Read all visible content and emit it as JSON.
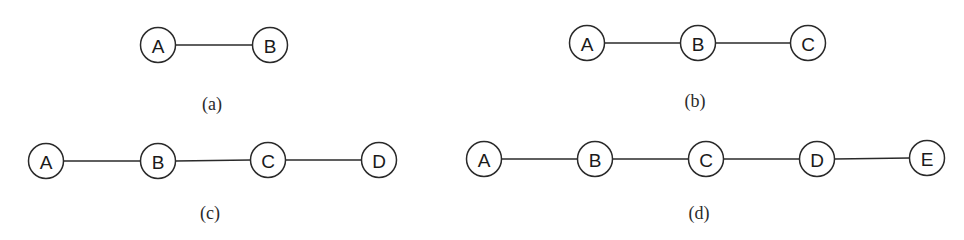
{
  "figure": {
    "node_radius": 17.5,
    "colors": {
      "stroke": "#2a2a2a",
      "fill": "#ffffff",
      "text": "#1a1a1a",
      "background": "#ffffff"
    },
    "panels": [
      {
        "id": "a",
        "caption": "(a)",
        "caption_pos": [
          212,
          104
        ],
        "nodes": [
          {
            "label": "A",
            "x": 158,
            "y": 45
          },
          {
            "label": "B",
            "x": 270,
            "y": 45
          }
        ],
        "edges": [
          [
            "A",
            "B"
          ]
        ]
      },
      {
        "id": "b",
        "caption": "(b)",
        "caption_pos": [
          695,
          101
        ],
        "nodes": [
          {
            "label": "A",
            "x": 587,
            "y": 43
          },
          {
            "label": "B",
            "x": 698,
            "y": 43
          },
          {
            "label": "C",
            "x": 808,
            "y": 43
          }
        ],
        "edges": [
          [
            "A",
            "B"
          ],
          [
            "B",
            "C"
          ]
        ]
      },
      {
        "id": "c",
        "caption": "(c)",
        "caption_pos": [
          210,
          213
        ],
        "nodes": [
          {
            "label": "A",
            "x": 46,
            "y": 161
          },
          {
            "label": "B",
            "x": 158,
            "y": 161
          },
          {
            "label": "C",
            "x": 268,
            "y": 160
          },
          {
            "label": "D",
            "x": 379,
            "y": 160
          }
        ],
        "edges": [
          [
            "A",
            "B"
          ],
          [
            "B",
            "C"
          ],
          [
            "C",
            "D"
          ]
        ]
      },
      {
        "id": "d",
        "caption": "(d)",
        "caption_pos": [
          699,
          213
        ],
        "nodes": [
          {
            "label": "A",
            "x": 484,
            "y": 159
          },
          {
            "label": "B",
            "x": 595,
            "y": 159
          },
          {
            "label": "C",
            "x": 706,
            "y": 159
          },
          {
            "label": "D",
            "x": 817,
            "y": 159
          },
          {
            "label": "E",
            "x": 927,
            "y": 158
          }
        ],
        "edges": [
          [
            "A",
            "B"
          ],
          [
            "B",
            "C"
          ],
          [
            "C",
            "D"
          ],
          [
            "D",
            "E"
          ]
        ]
      }
    ]
  }
}
